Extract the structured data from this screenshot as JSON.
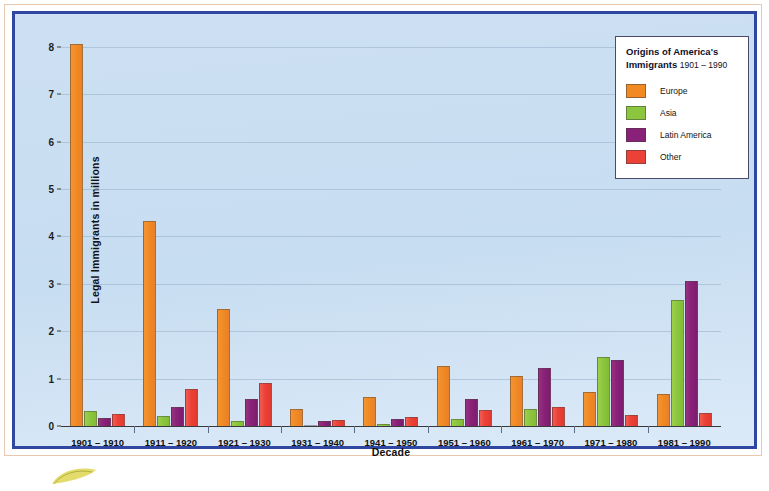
{
  "chart_data": {
    "type": "bar",
    "title": "Origins of America's Immigrants 1901 – 1990",
    "xlabel": "Decade",
    "ylabel": "Legal Immigrants in millions",
    "ylim": [
      0,
      8
    ],
    "yticks": [
      0,
      1,
      2,
      3,
      4,
      5,
      6,
      7,
      8
    ],
    "grid": true,
    "legend_position": "top-right",
    "categories": [
      "1901 – 1910",
      "1911 – 1920",
      "1921 – 1930",
      "1931 – 1940",
      "1941 – 1950",
      "1951 – 1960",
      "1961 – 1970",
      "1971 – 1980",
      "1981 – 1990"
    ],
    "series": [
      {
        "name": "Europe",
        "color": "#f18a22",
        "values": [
          8.06,
          4.32,
          2.46,
          0.35,
          0.62,
          1.27,
          1.05,
          0.72,
          0.67
        ]
      },
      {
        "name": "Asia",
        "color": "#8cc63f",
        "values": [
          0.32,
          0.22,
          0.11,
          0.02,
          0.04,
          0.15,
          0.35,
          1.46,
          2.65
        ]
      },
      {
        "name": "Latin America",
        "color": "#8a2179",
        "values": [
          0.17,
          0.41,
          0.56,
          0.1,
          0.14,
          0.57,
          1.22,
          1.4,
          3.05
        ]
      },
      {
        "name": "Other",
        "color": "#ec4136",
        "values": [
          0.25,
          0.79,
          0.9,
          0.13,
          0.19,
          0.34,
          0.4,
          0.23,
          0.28
        ]
      }
    ]
  },
  "legend": {
    "title_main": "Origins of America's Immigrants",
    "title_line1": "Origins of America's",
    "title_line2": "Immigrants",
    "title_years": "1901 – 1990",
    "entries": [
      {
        "label": "Europe",
        "color": "#f18a22",
        "swatch": "europe"
      },
      {
        "label": "Asia",
        "color": "#8cc63f",
        "swatch": "asia"
      },
      {
        "label": "Latin America",
        "color": "#8a2179",
        "swatch": "latin"
      },
      {
        "label": "Other",
        "color": "#ec4136",
        "swatch": "other"
      }
    ]
  },
  "axes": {
    "y_axis_label": "Legal Immigrants in millions",
    "x_axis_label": "Decade",
    "y_tick_labels": [
      "0",
      "1",
      "2",
      "3",
      "4",
      "5",
      "6",
      "7",
      "8"
    ]
  },
  "colors": {
    "frame_border": "#2f47a0",
    "outer_rule": "#e8c9b0",
    "plot_background": "#c8def2",
    "gridline": "#96afc8",
    "europe": "#f18a22",
    "asia": "#8cc63f",
    "latin_america": "#8a2179",
    "other": "#ec4136"
  }
}
